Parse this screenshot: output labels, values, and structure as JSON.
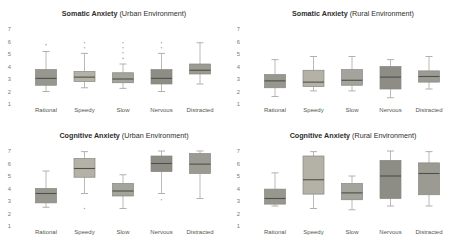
{
  "figure": {
    "background": "#ffffff"
  },
  "palette": {
    "box_stroke": "#87877f",
    "whisker": "#a8a8a4",
    "median": "#4f4f4b",
    "outlier": "#b0b0ac",
    "title_text": "#2e2e2c",
    "tick_text": "#7a7a76",
    "category_text": "#56564f"
  },
  "chart_data": [
    {
      "type": "box",
      "title_bold": "Somatic Anxiety",
      "title_rest": "(Urban Environment)",
      "categories": [
        "Rational",
        "Speedy",
        "Slow",
        "Nervous",
        "Distracted"
      ],
      "ylim": [
        1,
        7
      ],
      "yticks": [
        1,
        2,
        3,
        4,
        5,
        6,
        7
      ],
      "grid": false,
      "legend": "none",
      "series": [
        {
          "name": "Rational",
          "low": 2.0,
          "q1": 2.5,
          "median": 3.05,
          "q3": 3.75,
          "high": 5.2,
          "outliers": [
            5.75
          ],
          "fill": "#97978f"
        },
        {
          "name": "Speedy",
          "low": 2.3,
          "q1": 2.8,
          "median": 3.15,
          "q3": 3.6,
          "high": 5.05,
          "outliers": [
            5.5,
            5.9
          ],
          "fill": "#b4b1a6"
        },
        {
          "name": "Slow",
          "low": 2.25,
          "q1": 2.7,
          "median": 3.0,
          "q3": 3.5,
          "high": 4.2,
          "outliers": [
            4.65,
            5.1,
            5.5,
            5.9
          ],
          "fill": "#a4a49c"
        },
        {
          "name": "Nervous",
          "low": 2.0,
          "q1": 2.6,
          "median": 3.05,
          "q3": 3.75,
          "high": 5.05,
          "outliers": [
            5.5,
            5.9
          ],
          "fill": "#8d8d86"
        },
        {
          "name": "Distracted",
          "low": 2.6,
          "q1": 3.4,
          "median": 3.7,
          "q3": 4.2,
          "high": 5.9,
          "outliers": [],
          "fill": "#9b9b93"
        }
      ]
    },
    {
      "type": "box",
      "title_bold": "Somatic Anxiety",
      "title_rest": "(Rural Environment)",
      "categories": [
        "Rational",
        "Speedy",
        "Slow",
        "Nervous",
        "Distracted"
      ],
      "ylim": [
        1,
        7
      ],
      "yticks": [
        1,
        2,
        3,
        4,
        5,
        6,
        7
      ],
      "grid": false,
      "legend": "none",
      "series": [
        {
          "name": "Rational",
          "low": 1.6,
          "q1": 2.3,
          "median": 2.85,
          "q3": 3.35,
          "high": 4.55,
          "outliers": [],
          "fill": "#97978f"
        },
        {
          "name": "Speedy",
          "low": 2.05,
          "q1": 2.4,
          "median": 2.75,
          "q3": 3.7,
          "high": 4.8,
          "outliers": [],
          "fill": "#b4b1a6"
        },
        {
          "name": "Slow",
          "low": 2.05,
          "q1": 2.5,
          "median": 2.9,
          "q3": 3.75,
          "high": 4.8,
          "outliers": [],
          "fill": "#a4a49c"
        },
        {
          "name": "Nervous",
          "low": 1.5,
          "q1": 2.2,
          "median": 3.15,
          "q3": 4.0,
          "high": 4.55,
          "outliers": [],
          "fill": "#8d8d86"
        },
        {
          "name": "Distracted",
          "low": 2.2,
          "q1": 2.75,
          "median": 3.2,
          "q3": 3.65,
          "high": 4.8,
          "outliers": [],
          "fill": "#9b9b93"
        }
      ]
    },
    {
      "type": "box",
      "title_bold": "Cognitive Anxiety",
      "title_rest": "(Urban Environment)",
      "categories": [
        "Rational",
        "Speedy",
        "Slow",
        "Nervous",
        "Distracted"
      ],
      "ylim": [
        1,
        7
      ],
      "yticks": [
        1,
        2,
        3,
        4,
        5,
        6,
        7
      ],
      "grid": false,
      "legend": "none",
      "series": [
        {
          "name": "Rational",
          "low": 2.5,
          "q1": 2.85,
          "median": 3.6,
          "q3": 4.0,
          "high": 5.4,
          "outliers": [],
          "fill": "#97978f"
        },
        {
          "name": "Speedy",
          "low": 3.6,
          "q1": 4.9,
          "median": 5.6,
          "q3": 6.4,
          "high": 6.95,
          "outliers": [
            2.4
          ],
          "fill": "#b4b1a6"
        },
        {
          "name": "Slow",
          "low": 2.4,
          "q1": 3.4,
          "median": 3.8,
          "q3": 4.4,
          "high": 5.1,
          "outliers": [],
          "fill": "#a4a49c"
        },
        {
          "name": "Nervous",
          "low": 3.6,
          "q1": 5.35,
          "median": 6.0,
          "q3": 6.6,
          "high": 7.0,
          "outliers": [
            3.1
          ],
          "fill": "#8d8d86"
        },
        {
          "name": "Distracted",
          "low": 3.2,
          "q1": 5.2,
          "median": 5.95,
          "q3": 6.8,
          "high": 7.0,
          "outliers": [],
          "fill": "#9b9b93"
        }
      ]
    },
    {
      "type": "box",
      "title_bold": "Cognitive Anxiety",
      "title_rest": "(Rural Environment)",
      "categories": [
        "Rational",
        "Speedy",
        "Slow",
        "Nervous",
        "Distracted"
      ],
      "ylim": [
        1,
        7
      ],
      "yticks": [
        1,
        2,
        3,
        4,
        5,
        6,
        7
      ],
      "grid": false,
      "legend": "none",
      "series": [
        {
          "name": "Rational",
          "low": 2.6,
          "q1": 2.75,
          "median": 3.2,
          "q3": 3.95,
          "high": 5.25,
          "outliers": [],
          "fill": "#97978f"
        },
        {
          "name": "Speedy",
          "low": 2.4,
          "q1": 3.55,
          "median": 4.7,
          "q3": 6.6,
          "high": 6.95,
          "outliers": [],
          "fill": "#b4b1a6"
        },
        {
          "name": "Slow",
          "low": 2.3,
          "q1": 3.1,
          "median": 3.65,
          "q3": 4.4,
          "high": 5.0,
          "outliers": [],
          "fill": "#a4a49c"
        },
        {
          "name": "Nervous",
          "low": 2.6,
          "q1": 3.2,
          "median": 5.0,
          "q3": 6.25,
          "high": 7.0,
          "outliers": [],
          "fill": "#8d8d86"
        },
        {
          "name": "Distracted",
          "low": 2.6,
          "q1": 3.5,
          "median": 5.2,
          "q3": 6.05,
          "high": 6.95,
          "outliers": [],
          "fill": "#9b9b93"
        }
      ]
    }
  ]
}
